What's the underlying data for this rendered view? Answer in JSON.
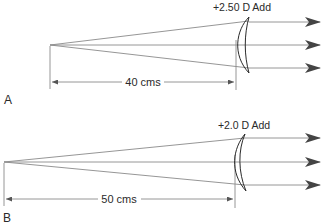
{
  "panels": [
    {
      "letter": "A",
      "lens_label": "+2.50 D Add",
      "distance_label": "40 cms"
    },
    {
      "letter": "B",
      "lens_label": "+2.0 D Add",
      "distance_label": "50 cms"
    }
  ],
  "colors": {
    "ray": "#8a8a8a",
    "arrowhead": "#444444",
    "lens": "#2a2a2a",
    "text": "#2a2a2a"
  }
}
